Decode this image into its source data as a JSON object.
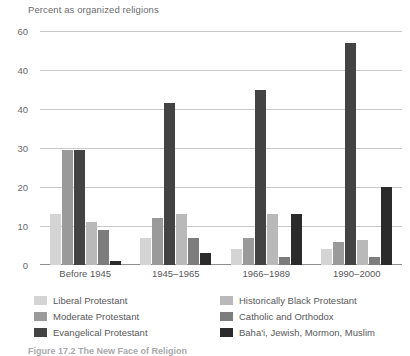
{
  "chart_data": {
    "type": "bar",
    "title": "Percent as organized religions",
    "xlabel": "",
    "ylabel": "Percent as organized religions",
    "categories": [
      "Before 1945",
      "1945–1965",
      "1966–1989",
      "1990–2000"
    ],
    "ylim": [
      0,
      60
    ],
    "yticks": [
      60,
      40,
      40,
      30,
      20,
      10,
      0
    ],
    "grid": true,
    "legend_position": "bottom",
    "series": [
      {
        "name": "Liberal Protestant",
        "color": "#d4d4d4",
        "values": [
          13,
          7,
          4,
          4
        ]
      },
      {
        "name": "Moderate Protestant",
        "color": "#9a9a9a",
        "values": [
          29.5,
          12,
          7,
          6
        ]
      },
      {
        "name": "Evangelical Protestant",
        "color": "#434343",
        "values": [
          29.5,
          41.5,
          45,
          57
        ]
      },
      {
        "name": "Historically Black Protestant",
        "color": "#b9b9b9",
        "values": [
          11,
          13,
          13,
          6.5
        ]
      },
      {
        "name": "Catholic and Orthodox",
        "color": "#7d7d7d",
        "values": [
          9,
          7,
          2,
          2
        ]
      },
      {
        "name": "Baha'i, Jewish, Mormon, Muslim",
        "color": "#2b2b2b",
        "values": [
          1,
          3,
          13,
          20
        ]
      }
    ]
  },
  "caption": "Figure 17.2  The New Face of Religion"
}
